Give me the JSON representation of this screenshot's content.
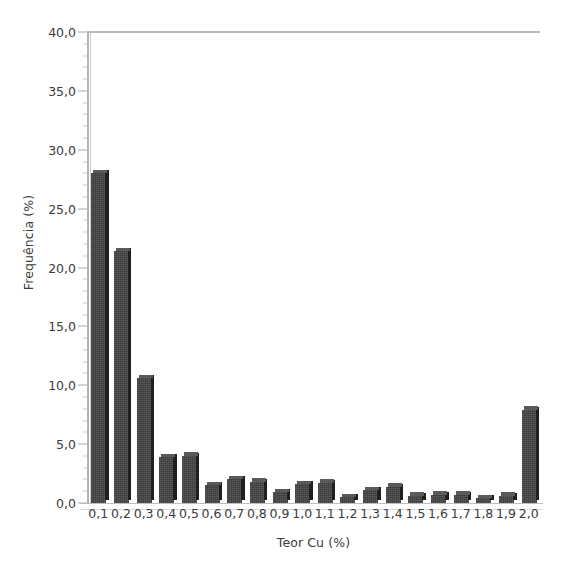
{
  "chart_data": {
    "type": "bar",
    "title": "",
    "subtitle": "",
    "xlabel": "Teor Cu (%)",
    "ylabel": "Frequência (%)",
    "categories": [
      "0,1",
      "0,2",
      "0,3",
      "0,4",
      "0,5",
      "0,6",
      "0,7",
      "0,8",
      "0,9",
      "1,0",
      "1,1",
      "1,2",
      "1,3",
      "1,4",
      "1,5",
      "1,6",
      "1,7",
      "1,8",
      "1,9",
      "2,0"
    ],
    "values": [
      28.0,
      21.4,
      10.6,
      3.9,
      4.0,
      1.5,
      2.0,
      1.8,
      0.9,
      1.6,
      1.7,
      0.5,
      1.1,
      1.4,
      0.6,
      0.7,
      0.7,
      0.4,
      0.6,
      7.9
    ],
    "ylim": [
      0.0,
      40.0
    ],
    "ytick_values": [
      0.0,
      5.0,
      10.0,
      15.0,
      20.0,
      25.0,
      30.0,
      35.0,
      40.0
    ],
    "ytick_labels": [
      "0,0",
      "5,0",
      "10,0",
      "15,0",
      "20,0",
      "25,0",
      "30,0",
      "35,0",
      "40,0"
    ],
    "yminor_step": 1.0,
    "grid": false,
    "legend": null,
    "bar_color": "#3b3b3b",
    "bar_side_color": "#1f1f1f",
    "bar_top_color": "#5a5a5a",
    "axis_color": "#b4b4b4",
    "text_color": "#3c3c3c",
    "background": "#ffffff",
    "annotations": []
  }
}
